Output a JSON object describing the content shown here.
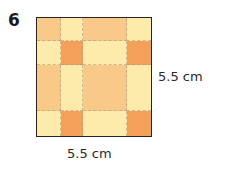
{
  "problem": {
    "number": "6"
  },
  "figure": {
    "type": "square-tile-pattern",
    "side_label_right": "5.5 cm",
    "side_label_bottom": "5.5 cm",
    "colors": {
      "peach": "#f9c98a",
      "cream": "#fcebaa",
      "orange": "#f5a05a",
      "border": "#2a2320"
    },
    "grid": {
      "columns": 4,
      "rows": 4,
      "tiles": [
        [
          "peach",
          "cream",
          "peach",
          "cream"
        ],
        [
          "cream",
          "orange",
          "cream",
          "orange"
        ],
        [
          "peach",
          "cream",
          "peach",
          "cream"
        ],
        [
          "cream",
          "orange",
          "cream",
          "orange"
        ]
      ]
    }
  }
}
